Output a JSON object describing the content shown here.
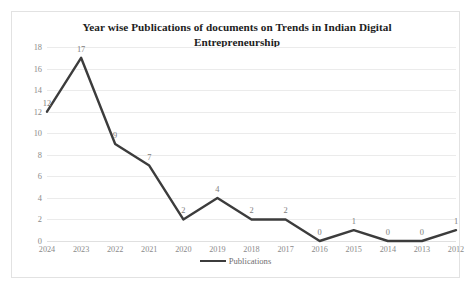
{
  "chart_data": {
    "type": "line",
    "title": "Year wise Publications of documents on Trends in Indian Digital Entrepreneurship",
    "title_line1": "Year wise Publications of documents on Trends in Indian Digital",
    "title_line2": "Entrepreneurship",
    "xlabel": "",
    "ylabel": "",
    "categories": [
      "2024",
      "2023",
      "2022",
      "2021",
      "2020",
      "2019",
      "2018",
      "2017",
      "2016",
      "2015",
      "2014",
      "2013",
      "2012"
    ],
    "values": [
      12,
      17,
      9,
      7,
      2,
      4,
      2,
      2,
      0,
      1,
      0,
      0,
      1
    ],
    "series": [
      {
        "name": "Publications",
        "values": [
          12,
          17,
          9,
          7,
          2,
          4,
          2,
          2,
          0,
          1,
          0,
          0,
          1
        ],
        "color": "#3c3c3c"
      }
    ],
    "ylim": [
      0,
      18
    ],
    "yticks": [
      0,
      2,
      4,
      6,
      8,
      10,
      12,
      14,
      16,
      18
    ],
    "grid": true,
    "data_labels": [
      "12",
      "17",
      "9",
      "7",
      "2",
      "4",
      "2",
      "2",
      "0",
      "1",
      "0",
      "0",
      "1"
    ],
    "legend": {
      "position": "bottom",
      "entries": [
        "Publications"
      ]
    }
  },
  "legend": {
    "label": "Publications"
  },
  "colors": {
    "line": "#3c3c3c",
    "grid": "#ebebeb",
    "tick_text": "#8a8a8a",
    "title_text": "#1d1d1d",
    "frame": "#e2e2e2"
  }
}
